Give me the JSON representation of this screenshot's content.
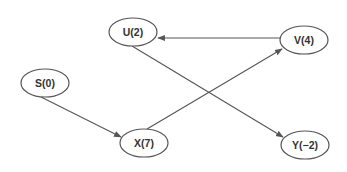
{
  "diagram": {
    "type": "directed-graph",
    "colors": {
      "stroke": "#555555",
      "text": "#333333",
      "background": "#ffffff"
    },
    "nodes": [
      {
        "id": "U",
        "label": "U(2)",
        "x": 133,
        "y": 32,
        "rx": 24,
        "ry": 14
      },
      {
        "id": "V",
        "label": "V(4)",
        "x": 304,
        "y": 40,
        "rx": 24,
        "ry": 14
      },
      {
        "id": "S",
        "label": "S(0)",
        "x": 45,
        "y": 83,
        "rx": 24,
        "ry": 14
      },
      {
        "id": "X",
        "label": "X(7)",
        "x": 144,
        "y": 143,
        "rx": 24,
        "ry": 14
      },
      {
        "id": "Y",
        "label": "Y(−2)",
        "x": 305,
        "y": 145,
        "rx": 24,
        "ry": 14
      }
    ],
    "edges": [
      {
        "from": "V",
        "to": "U",
        "x1": 280,
        "y1": 38,
        "x2": 158,
        "y2": 38
      },
      {
        "from": "U",
        "to": "Y",
        "x1": 132,
        "y1": 46,
        "x2": 283,
        "y2": 137
      },
      {
        "from": "S",
        "to": "X",
        "x1": 41,
        "y1": 97,
        "x2": 121,
        "y2": 137
      },
      {
        "from": "X",
        "to": "V",
        "x1": 147,
        "y1": 129,
        "x2": 282,
        "y2": 49
      }
    ]
  }
}
